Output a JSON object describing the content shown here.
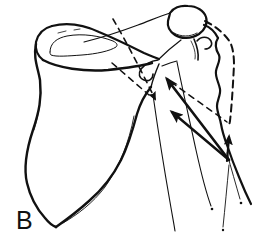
{
  "figure": {
    "label": "B",
    "ink": "#111111",
    "background": "#ffffff",
    "canvas": {
      "width": 253,
      "height": 241
    },
    "label_style": {
      "x": 16,
      "y": 229,
      "size": 25,
      "weight": "400"
    },
    "shapes": [
      {
        "name": "scapula-medial-border",
        "type": "path",
        "w": 2.4,
        "d": "M36,44 C33,58 38,68 40,80 C42,98 39,112 33,130 C27,148 23,166 27,183 C30,196 36,208 45,218 C49,223 53,226 56,227"
      },
      {
        "name": "scapula-lateral-border",
        "type": "path",
        "w": 2.4,
        "d": "M56,227 C66,220 78,211 89,201 C104,188 114,174 121,160 C129,144 133,129 137,114 C141,101 146,93 151,87"
      },
      {
        "name": "scapula-lateral-inner-line",
        "type": "path",
        "w": 0.9,
        "d": "M134,116 C129,143 119,167 105,187 C93,203 77,215 63,223"
      },
      {
        "name": "scapula-medial-inner-line",
        "type": "path",
        "w": 0.8,
        "d": "M40,84 C41,100 39,114 34,130"
      },
      {
        "name": "scapula-neck-line",
        "type": "path",
        "w": 1.4,
        "d": "M151,87 C153,79 156,71 159,64"
      },
      {
        "name": "spine-top-edge",
        "type": "path",
        "w": 2.2,
        "d": "M52,26 C68,22 84,25 99,32 C116,39 132,47 144,53 C151,56 156,58 159,59"
      },
      {
        "name": "spine-left-end",
        "type": "path",
        "w": 2.2,
        "d": "M52,26 C44,28 38,34 36,42 C35,48 37,55 43,60"
      },
      {
        "name": "spine-bottom-edge",
        "type": "path",
        "w": 2.4,
        "d": "M43,60 C58,68 84,72 108,70 C126,68 141,66 152,63"
      },
      {
        "name": "supraspinous-fossa-teardrop",
        "type": "path",
        "w": 1.0,
        "d": "M50,52 C50,43 57,38 67,36 C83,33 100,36 113,41 C117,43 118,45 116,47 C110,51 96,54 82,55 C68,56 56,57 51,55 C50,54 50,53 50,52"
      },
      {
        "name": "spine-hatch-tick-1",
        "type": "path",
        "w": 0.8,
        "d": "M58,33 L66,31"
      },
      {
        "name": "spine-hatch-tick-2",
        "type": "path",
        "w": 0.8,
        "d": "M74,30 L80,29"
      },
      {
        "name": "spine-crest-line",
        "type": "path",
        "w": 1.1,
        "d": "M84,42 C104,37 122,31 138,25 C149,21 160,16 170,13"
      },
      {
        "name": "acromion-outline",
        "type": "path",
        "w": 2.2,
        "d": "M170,13 C173,8 180,5 188,6 C197,6 204,11 206,17 C208,23 205,30 199,34 C191,39 181,39 175,35 C169,31 167,27 168,21 C169,17 170,14 170,13"
      },
      {
        "name": "acromion-inner-line",
        "type": "path",
        "w": 0.9,
        "d": "M174,33 C181,37 190,37 197,33"
      },
      {
        "name": "glenoid-rim-line",
        "type": "path",
        "w": 1.2,
        "d": "M159,59 C165,53 173,46 181,40"
      },
      {
        "name": "glenoid-hook",
        "type": "path",
        "w": 1.6,
        "d": "M158,60 C151,61 145,64 141,69 C138,74 139,78 144,80 C149,82 153,79 153,74"
      },
      {
        "name": "humeral-head-top-edge",
        "type": "path",
        "w": 2.2,
        "d": "M204,25 C210,27 215,32 218,38"
      },
      {
        "name": "greater-tuberosity-curl",
        "type": "path",
        "w": 1.6,
        "d": "M197,41 C201,36 208,36 211,41 C213,45 210,49 205,49"
      },
      {
        "name": "humeral-head-left-edge",
        "type": "path",
        "w": 1.6,
        "d": "M194,39 C197,46 199,53 198,60"
      },
      {
        "name": "humeral-head-left-inner",
        "type": "path",
        "w": 0.8,
        "d": "M191,41 C194,47 196,53 195,59"
      },
      {
        "name": "humeral-head-bottom",
        "type": "path",
        "w": 1.2,
        "d": "M162,66 C167,64 172,62 177,61"
      },
      {
        "name": "humerus-lateral-edge",
        "type": "path",
        "w": 2.2,
        "d": "M218,38 C214,44 216,50 219,55 C221,60 217,65 216,71 C215,77 219,83 220,89 C221,95 217,100 217,106 C217,112 220,118 221,124 C222,130 224,137 227,145 C230,154 234,165 239,177 C243,187 247,196 251,204"
      },
      {
        "name": "humerus-medial-edge",
        "type": "path",
        "w": 1.1,
        "d": "M177,62 C183,92 190,122 196,150 C202,177 207,195 211,206"
      },
      {
        "name": "humerus-medial-end-dot",
        "type": "dot",
        "cx": 212,
        "cy": 209,
        "r": 1.3
      },
      {
        "name": "humerus-shaft-inner-line",
        "type": "path",
        "w": 0.9,
        "d": "M227,153 C231,168 236,185 240,199"
      },
      {
        "name": "shaft-inner-end-dot",
        "type": "dot",
        "cx": 241,
        "cy": 203,
        "r": 1.3
      },
      {
        "name": "triceps-origin-line",
        "type": "path",
        "w": 1.1,
        "d": "M153,95 C158,130 164,168 170,202 C172,214 174,224 175,231"
      },
      {
        "name": "shaft-axis-lower-line",
        "type": "path",
        "w": 0.9,
        "d": "M229,165 C227,186 225,208 223,227"
      },
      {
        "name": "shaft-axis-end-dot",
        "type": "dot",
        "cx": 223,
        "cy": 230,
        "r": 1.2
      },
      {
        "name": "displaced-humerus-dashed-outline",
        "type": "path",
        "w": 2.0,
        "dash": "7,5",
        "d": "M205,21 C215,26 224,33 230,42 C233,48 234,56 234,65 C233,84 232,103 230,121 L229,126"
      },
      {
        "name": "dashed-reference-line-upper",
        "type": "path",
        "w": 1.6,
        "dash": "6,5",
        "marker": "small",
        "d": "M113,19 C127,43 142,72 155,99"
      },
      {
        "name": "dashed-vector-to-displaced-head",
        "type": "path",
        "w": 1.5,
        "dash": "6,5",
        "d": "M171,82 L227,122"
      },
      {
        "name": "dashed-line-of-action-extension",
        "type": "path",
        "w": 1.5,
        "dash": "6,5",
        "d": "M112,63 L149,95"
      },
      {
        "name": "force-vector-to-glenoid",
        "type": "path",
        "w": 2.6,
        "marker": "big",
        "d": "M229,160 L167,79"
      },
      {
        "name": "force-vector-below-glenoid",
        "type": "path",
        "w": 2.4,
        "marker": "big",
        "d": "M229,160 L172,112"
      },
      {
        "name": "force-vector-vertical",
        "type": "path",
        "w": 2.2,
        "marker": "mid",
        "d": "M227,161 L229,137"
      }
    ]
  }
}
